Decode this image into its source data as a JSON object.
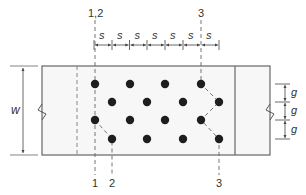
{
  "diagram": {
    "type": "staggered-fastener-pattern",
    "colors": {
      "line": "#555555",
      "dot": "#1e1e1e",
      "text": "#333333",
      "plate_fill": "#f7f7f7"
    },
    "dimensions": {
      "width_label": "w",
      "pitch_label": "s",
      "gage_label": "g",
      "pitch_count": 7,
      "gage_count": 3
    },
    "section_labels": {
      "top_left": "1,2",
      "top_right": "3",
      "bottom": [
        "1",
        "2",
        "3"
      ]
    },
    "fastener_rows": [
      {
        "row": 1,
        "columns": [
          0,
          2,
          4,
          6
        ]
      },
      {
        "row": 2,
        "columns": [
          1,
          3,
          5,
          7
        ]
      },
      {
        "row": 3,
        "columns": [
          0,
          2,
          4,
          6
        ]
      },
      {
        "row": 4,
        "columns": [
          1,
          3,
          5,
          7
        ]
      }
    ]
  }
}
